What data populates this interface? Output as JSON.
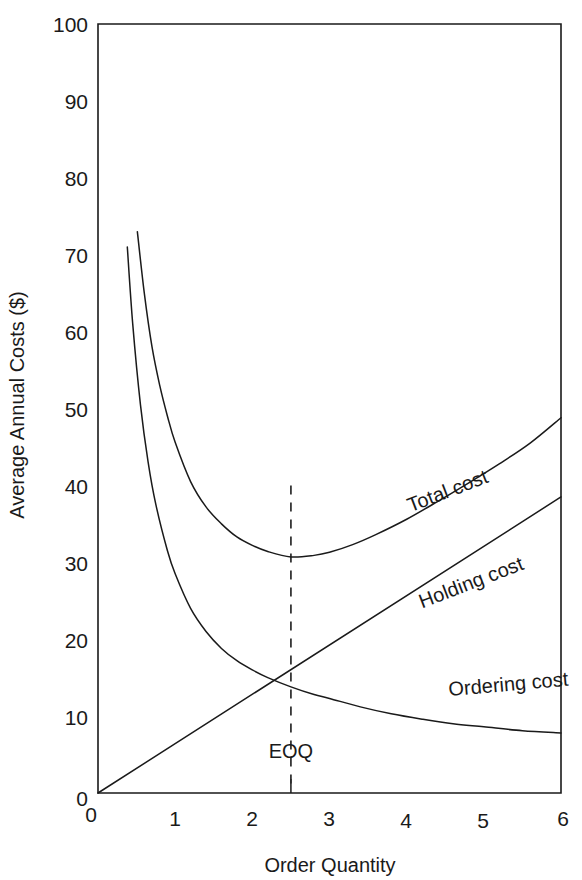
{
  "chart_data": {
    "type": "line",
    "title": "",
    "xlabel": "Order Quantity",
    "ylabel": "Average Annual Costs ($)",
    "xlim": [
      0,
      6
    ],
    "ylim": [
      0,
      100
    ],
    "grid": false,
    "legend_position": "inline-curve-labels",
    "x_ticks": [
      "0",
      "1",
      "2",
      "3",
      "4",
      "5",
      "6"
    ],
    "x_tick_values": [
      0,
      1,
      2,
      3,
      4,
      5,
      6
    ],
    "y_ticks": [
      "0",
      "10",
      "20",
      "30",
      "40",
      "50",
      "60",
      "70",
      "80",
      "90",
      "100"
    ],
    "y_tick_values": [
      0,
      10,
      20,
      30,
      40,
      50,
      60,
      70,
      80,
      90,
      100
    ],
    "annotations": [
      {
        "name": "eoq-marker",
        "text": "EOQ",
        "x": 2.5,
        "y_text": 4.5,
        "line_from_y": 40,
        "line_to_y": 0,
        "style": "dashed-vertical"
      }
    ],
    "series": [
      {
        "name": "Total cost",
        "label": "Total cost",
        "label_x": 4.05,
        "label_y": 36.5,
        "label_rotation": -21,
        "x": [
          0.51,
          0.6,
          0.7,
          0.8,
          0.9,
          1.0,
          1.2,
          1.4,
          1.6,
          1.8,
          2.0,
          2.2,
          2.5,
          2.8,
          3.0,
          3.3,
          3.6,
          4.0,
          4.4,
          4.8,
          5.2,
          5.6,
          6.0
        ],
        "values": [
          73.0,
          65.0,
          58.0,
          53.0,
          49.0,
          45.6,
          40.5,
          37.2,
          35.0,
          33.3,
          32.2,
          31.4,
          30.7,
          30.9,
          31.3,
          32.3,
          33.6,
          35.6,
          37.9,
          40.3,
          42.8,
          45.5,
          48.8
        ]
      },
      {
        "name": "Ordering cost",
        "label": "Ordering cost",
        "label_x": 4.55,
        "label_y": 12.6,
        "label_rotation": -5,
        "x": [
          0.38,
          0.45,
          0.55,
          0.65,
          0.75,
          0.9,
          1.0,
          1.2,
          1.4,
          1.6,
          1.8,
          2.0,
          2.2,
          2.5,
          2.8,
          3.0,
          3.4,
          3.8,
          4.2,
          4.6,
          5.0,
          5.5,
          6.0
        ],
        "values": [
          71.0,
          61.0,
          50.5,
          43.0,
          37.5,
          31.5,
          28.5,
          24.0,
          21.0,
          18.8,
          17.2,
          16.0,
          15.0,
          13.8,
          12.8,
          12.3,
          11.2,
          10.3,
          9.6,
          9.0,
          8.6,
          8.1,
          7.8
        ]
      },
      {
        "name": "Holding cost",
        "label": "Holding cost",
        "label_x": 4.2,
        "label_y": 24.0,
        "label_rotation": -21,
        "x": [
          0,
          6
        ],
        "values": [
          0,
          38.5
        ]
      }
    ]
  }
}
